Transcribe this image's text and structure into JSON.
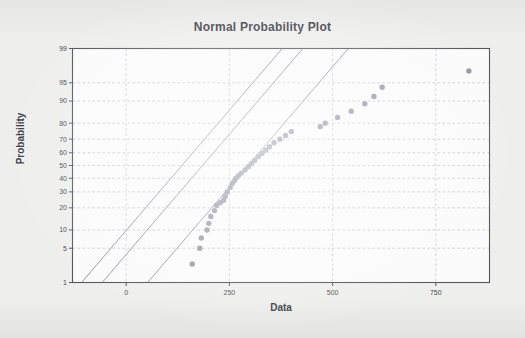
{
  "chart_data": {
    "type": "scatter",
    "title": "Normal Probability Plot",
    "xlabel": "Data",
    "ylabel": "Probability",
    "grid": true,
    "legend": false,
    "xlim": [
      -130,
      880
    ],
    "ylim": [
      1,
      99
    ],
    "yscale": "normal-probability",
    "xticks": [
      0,
      250,
      500,
      750
    ],
    "xtick_labels": [
      "0",
      "250",
      "500",
      "750"
    ],
    "yticks": [
      99,
      95,
      90,
      80,
      70,
      60,
      50,
      40,
      30,
      20,
      10,
      5,
      1
    ],
    "ytick_labels": [
      "99",
      "95",
      "90",
      "80",
      "70",
      "60",
      "50",
      "40",
      "30",
      "20",
      "10",
      "5",
      "1"
    ],
    "point_color": "#8d8da4",
    "line_color": "#8a8a96",
    "frame_color": "#55555e",
    "grid_color": "#b9b9c6",
    "background_color": "#eeeeec",
    "panel_color": "#fbfbfb",
    "series": [
      {
        "name": "Data points",
        "marker": "filled-circle",
        "x": [
          160,
          178,
          182,
          196,
          200,
          205,
          214,
          219,
          228,
          236,
          240,
          245,
          252,
          257,
          262,
          266,
          272,
          279,
          288,
          296,
          303,
          311,
          320,
          329,
          338,
          347,
          358,
          372,
          386,
          400,
          470,
          482,
          512,
          545,
          578,
          600,
          620,
          830
        ],
        "y": [
          2.5,
          5.0,
          7.5,
          10.0,
          12.5,
          15.5,
          18.5,
          21.5,
          23.0,
          24.5,
          27.0,
          30.0,
          33.0,
          36.0,
          38.0,
          40.0,
          42.0,
          44.0,
          46.5,
          49.0,
          51.5,
          54.0,
          57.0,
          59.5,
          62.0,
          64.5,
          67.5,
          70.0,
          72.5,
          75.0,
          78.0,
          80.0,
          83.0,
          86.0,
          89.0,
          91.5,
          94.0,
          97.0
        ]
      }
    ],
    "reference_lines": [
      {
        "name": "upper-confidence-bound",
        "x": [
          -108,
          378
        ],
        "y": [
          1,
          99
        ]
      },
      {
        "name": "fitted-normal-line",
        "x": [
          -58,
          428
        ],
        "y": [
          1,
          99
        ]
      },
      {
        "name": "lower-confidence-bound",
        "x": [
          52,
          538
        ],
        "y": [
          1,
          99
        ]
      }
    ]
  },
  "figure": {
    "title": "Normal Probability Plot",
    "xlabel": "Data",
    "ylabel": "Probability"
  }
}
